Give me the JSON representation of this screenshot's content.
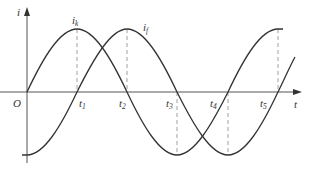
{
  "diagram": {
    "axes": {
      "y_label": "i",
      "x_label": "t",
      "origin_label": "O"
    },
    "curves": [
      {
        "name": "i_k",
        "label_main": "i",
        "label_sub": "k",
        "phase": "sine starting at 0, rising"
      },
      {
        "name": "i_f",
        "label_main": "i",
        "label_sub": "f",
        "phase": "lags i_k by quarter period"
      }
    ],
    "time_marks": [
      {
        "main": "t",
        "sub": "1"
      },
      {
        "main": "t",
        "sub": "2"
      },
      {
        "main": "t",
        "sub": "3"
      },
      {
        "main": "t",
        "sub": "4"
      },
      {
        "main": "t",
        "sub": "5"
      }
    ],
    "colors": {
      "curve": "#333333",
      "axis": "#555555",
      "dashed": "#888888"
    }
  }
}
